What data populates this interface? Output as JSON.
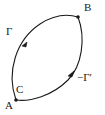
{
  "figure": {
    "type": "geometric-contour-diagram",
    "background_color": "#ffffff",
    "stroke_color": "#1a1a1a",
    "label_color": "#1a1a1a"
  },
  "labels": {
    "curve_left": "Γ",
    "curve_right": "−Γ′",
    "vertex_bottom": "A",
    "vertex_top": "B",
    "point_interior": "C"
  },
  "vertices": [
    {
      "name": "A",
      "label": "A",
      "x": 16,
      "y": 100,
      "marker": "dot"
    },
    {
      "name": "B",
      "label": "B",
      "x": 78,
      "y": 17,
      "marker": "dot"
    }
  ],
  "arcs": [
    {
      "name": "left-arc",
      "label": "Γ",
      "from": "A",
      "to": "B",
      "bulge": "left",
      "direction": "A-to-B",
      "arrow_at": {
        "x": 27,
        "y": 42
      }
    },
    {
      "name": "right-arc",
      "label": "−Γ′",
      "from": "A",
      "to": "B",
      "bulge": "right",
      "direction": "A-to-B",
      "arrow_at": {
        "x": 73,
        "y": 73
      }
    }
  ],
  "markers": {
    "point_c_label": "C",
    "arrowhead_count": 2,
    "vertex_dot_count": 2
  }
}
